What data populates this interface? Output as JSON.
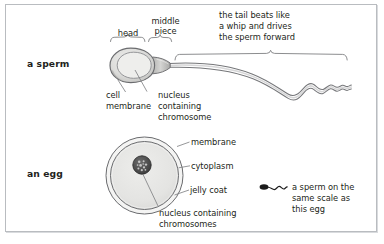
{
  "figure": {
    "title_caption": "",
    "background_color": "#ffffff",
    "border_color": "#b9bcc0",
    "ink_color": "#231f20",
    "line_color": "#6e6f72"
  },
  "rows": {
    "sperm_row_label": "a sperm",
    "egg_row_label": "an egg"
  },
  "sperm": {
    "bracket_labels": {
      "head": "head",
      "middle_piece_line1": "middle",
      "middle_piece_line2": "piece"
    },
    "tail_note": {
      "line1": "the tail beats like",
      "line2": "a whip and drives",
      "line3": "the sperm forward"
    },
    "callouts": {
      "cell_membrane_line1": "cell",
      "cell_membrane_line2": "membrane",
      "nucleus_line1": "nucleus",
      "nucleus_line2": "containing",
      "nucleus_line3": "chromosome"
    },
    "colors": {
      "head_outline": "#6b6c6f",
      "head_fill": "#c9c9c7",
      "head_inner_fill": "#e2e2e0",
      "midpiece_fill": "#b9b9b7",
      "tail_stroke": "#7a7b7e"
    }
  },
  "egg": {
    "callouts": {
      "membrane": "membrane",
      "cytoplasm": "cytoplasm",
      "jelly_coat": "jelly coat",
      "nucleus_line1": "nucleus containing",
      "nucleus_line2": "chromosomes"
    },
    "colors": {
      "jelly_outline": "#6b6c6f",
      "cytoplasm_fill": "#e4e4e2",
      "jelly_fill": "#f2f2f1",
      "nucleus_fill": "#4a4a4a"
    }
  },
  "scale_note": {
    "line1": "a sperm on the",
    "line2": "same scale as",
    "line3": "this egg",
    "icon": "mini-sperm-icon"
  }
}
